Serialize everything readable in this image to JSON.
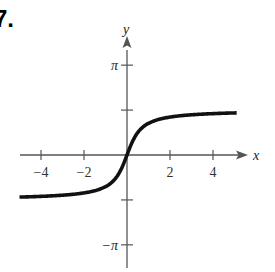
{
  "problem_number": "7.",
  "chart_data": {
    "type": "line",
    "title": "",
    "xlabel": "x",
    "ylabel": "y",
    "function": "y = arctan(2x)",
    "xlim": [
      -5,
      5.3
    ],
    "ylim": [
      -3.6,
      3.6
    ],
    "x_ticks": [
      -4,
      -2,
      2,
      4
    ],
    "x_tick_labels": [
      "−4",
      "−2",
      "2",
      "4"
    ],
    "y_ticks": [
      3.14159,
      1.5708,
      -1.5708,
      -3.14159
    ],
    "y_tick_labels": [
      "π",
      "",
      "",
      "−π"
    ],
    "grid": false,
    "legend": null,
    "series": [
      {
        "name": "curve",
        "x": [
          -5,
          -4,
          -3,
          -2,
          -1.5,
          -1,
          -0.5,
          0,
          0.5,
          1,
          1.5,
          2,
          3,
          4,
          5
        ],
        "y": [
          -1.471,
          -1.446,
          -1.406,
          -1.326,
          -1.249,
          -1.107,
          -0.785,
          0,
          0.785,
          1.107,
          1.249,
          1.326,
          1.406,
          1.446,
          1.471
        ]
      }
    ]
  }
}
